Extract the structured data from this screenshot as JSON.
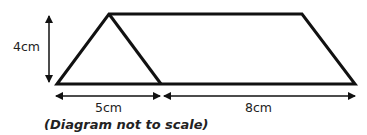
{
  "diagram": {
    "type": "geometry-figure",
    "labels": {
      "height": "4cm",
      "left_base": "5cm",
      "right_base": "8cm"
    },
    "note": "(Diagram not to scale)",
    "shapes": {
      "outline_points": [
        [
          57,
          84
        ],
        [
          109,
          14
        ],
        [
          302,
          14
        ],
        [
          355,
          84
        ]
      ],
      "inner_edge": [
        [
          109,
          14
        ],
        [
          161,
          84
        ]
      ],
      "base_line": [
        [
          57,
          84
        ],
        [
          355,
          84
        ]
      ]
    },
    "colors": {
      "stroke": "#111111",
      "text": "#222222",
      "background": "#ffffff"
    }
  }
}
